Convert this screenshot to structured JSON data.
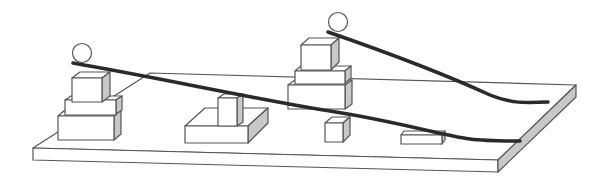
{
  "diagram": {
    "colors": {
      "background": "#ffffff",
      "outline": "#555555",
      "face": "#ffffff",
      "shade": "#c8c8c8",
      "rail": "#2a2a2a"
    },
    "objects": [
      {
        "name": "board",
        "type": "plank"
      },
      {
        "name": "left-stack",
        "blocks": 3,
        "has_ball": true
      },
      {
        "name": "center-left-block",
        "blocks": 2
      },
      {
        "name": "center-stack",
        "blocks": 3,
        "has_ball": true
      },
      {
        "name": "small-cube",
        "blocks": 1
      },
      {
        "name": "flat-bar",
        "blocks": 1
      },
      {
        "name": "ramp-1",
        "from": "left-stack",
        "to": "board-right-edge"
      },
      {
        "name": "ramp-2",
        "from": "center-stack",
        "to": "board-right-edge"
      }
    ]
  }
}
